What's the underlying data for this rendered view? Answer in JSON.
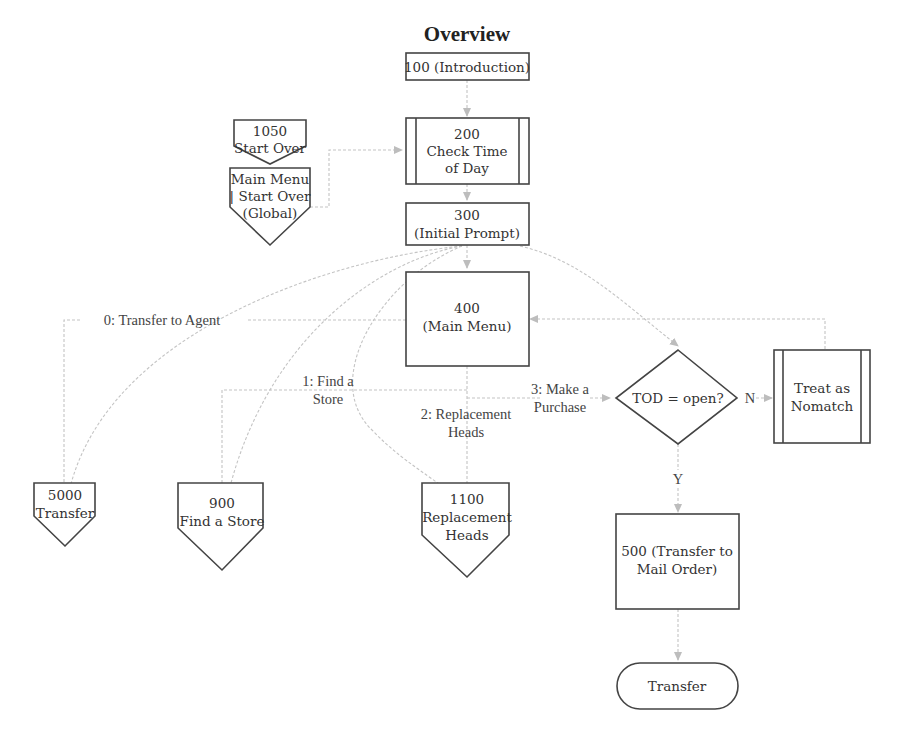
{
  "title": "Overview",
  "nodes": {
    "n100": {
      "label_lines": [
        "100 (Introduction)"
      ],
      "shape": "rectangle"
    },
    "n200": {
      "label_lines": [
        "200",
        "Check Time",
        "of Day"
      ],
      "shape": "predefined-process"
    },
    "n300": {
      "label_lines": [
        "300",
        "(Initial Prompt)"
      ],
      "shape": "rectangle"
    },
    "n400": {
      "label_lines": [
        "400",
        "(Main Menu)"
      ],
      "shape": "rectangle"
    },
    "n1050": {
      "label_lines": [
        "1050",
        "Start Over"
      ],
      "shape": "off-page-connector"
    },
    "global": {
      "label_lines": [
        "Main Menu",
        "| Start Over",
        "(Global)"
      ],
      "shape": "off-page-connector"
    },
    "tod": {
      "label_lines": [
        "TOD = open?"
      ],
      "shape": "decision"
    },
    "nomatch": {
      "label_lines": [
        "Treat as",
        "Nomatch"
      ],
      "shape": "predefined-process"
    },
    "n5000": {
      "label_lines": [
        "5000",
        "Transfer"
      ],
      "shape": "off-page-connector"
    },
    "n900": {
      "label_lines": [
        "900",
        "Find a Store"
      ],
      "shape": "off-page-connector"
    },
    "n1100": {
      "label_lines": [
        "1100",
        "Replacement",
        "Heads"
      ],
      "shape": "off-page-connector"
    },
    "n500": {
      "label_lines": [
        "500 (Transfer to",
        "Mail Order)"
      ],
      "shape": "rectangle"
    },
    "transfer": {
      "label_lines": [
        "Transfer"
      ],
      "shape": "terminator"
    }
  },
  "edge_labels": {
    "opt0": "0: Transfer to Agent",
    "opt1_line1": "1: Find a",
    "opt1_line2": "Store",
    "opt2_line1": "2: Replacement",
    "opt2_line2": "Heads",
    "opt3_line1": "3: Make a",
    "opt3_line2": "Purchase",
    "no": "N",
    "yes": "Y"
  },
  "edges": [
    {
      "from": "n100",
      "to": "n200"
    },
    {
      "from": "global",
      "to": "n200"
    },
    {
      "from": "n200",
      "to": "n300"
    },
    {
      "from": "n300",
      "to": "n400"
    },
    {
      "from": "n300",
      "to": "n5000",
      "style": "curve"
    },
    {
      "from": "n300",
      "to": "n900",
      "style": "curve"
    },
    {
      "from": "n300",
      "to": "n1100",
      "style": "curve"
    },
    {
      "from": "n300",
      "to": "tod",
      "style": "curve"
    },
    {
      "from": "n400",
      "to": "n5000",
      "label": "0: Transfer to Agent"
    },
    {
      "from": "n400",
      "to": "n900",
      "label": "1: Find a Store"
    },
    {
      "from": "n400",
      "to": "n1100",
      "label": "2: Replacement Heads"
    },
    {
      "from": "n400",
      "to": "tod",
      "label": "3: Make a Purchase"
    },
    {
      "from": "tod",
      "to": "nomatch",
      "label": "N"
    },
    {
      "from": "tod",
      "to": "n500",
      "label": "Y"
    },
    {
      "from": "nomatch",
      "to": "n400"
    },
    {
      "from": "n500",
      "to": "transfer"
    }
  ],
  "colors": {
    "shape_stroke": "#444444",
    "connector": "#c4c4c4",
    "text": "#333333"
  }
}
